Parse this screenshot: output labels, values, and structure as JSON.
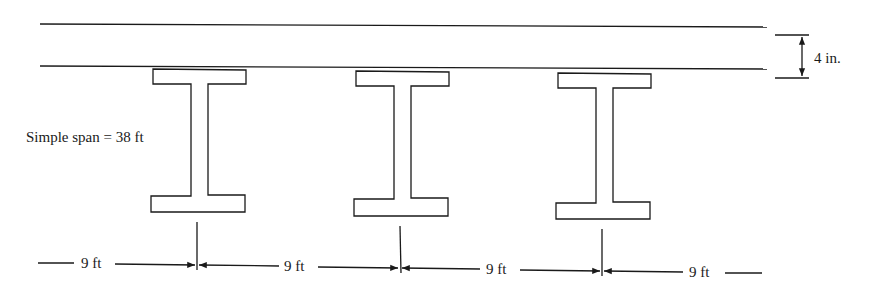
{
  "diagram": {
    "slab_thickness_label": "4 in.",
    "span_label": "Simple span = 38 ft",
    "spacing_labels": [
      "9 ft",
      "9 ft",
      "9 ft",
      "9 ft"
    ],
    "girders": [
      {
        "id": 1,
        "center_x": 199
      },
      {
        "id": 2,
        "center_x": 401
      },
      {
        "id": 3,
        "center_x": 603
      }
    ],
    "colors": {
      "line": "#1a1a1a",
      "background": "#ffffff"
    }
  }
}
